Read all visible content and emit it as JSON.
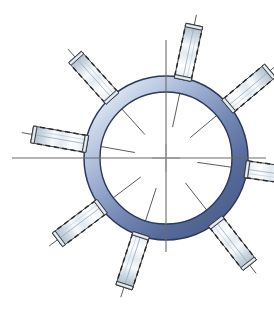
{
  "document": {
    "title": "Radial Bolt Ring Assembly",
    "background_color": "#ffffff",
    "width": 274,
    "height": 322,
    "drawing_type": "mechanical-assembly-schematic"
  },
  "ring": {
    "name": "annular-flange",
    "center_x": 166,
    "center_y": 158,
    "outer_radius": 82,
    "inner_radius": 66,
    "outline_color": "#2b3a5c",
    "outline_width": 1.4,
    "gradient_light": "#e8edf6",
    "gradient_mid": "#aab9d8",
    "gradient_dark": "#5f739f",
    "gradient_darkest": "#4a5c86"
  },
  "centerlines": {
    "name": "center-axes",
    "color": "#6b6b6b",
    "width": 1,
    "horizontal": {
      "x1": 12,
      "y1": 158,
      "x2": 266,
      "y2": 158
    },
    "vertical": {
      "x1": 166,
      "y1": 40,
      "x2": 166,
      "y2": 252
    },
    "crosshair_arm": 18
  },
  "bolts": {
    "count": 8,
    "body_color_light": "#ffffff",
    "body_color_mid": "#dfe6ee",
    "body_color_shade": "#b9c6d2",
    "outline_color": "#3a3a3a",
    "thread_dash_color": "#2b2b2b",
    "axis_color": "#4a4a4a",
    "length": 56,
    "width": 17,
    "items": [
      {
        "id": "bolt-1",
        "label": "bolt-n",
        "angle_deg": -78,
        "mount_radius": 74,
        "offset": 34
      },
      {
        "id": "bolt-2",
        "label": "bolt-ne",
        "angle_deg": -40,
        "mount_radius": 74,
        "offset": 34
      },
      {
        "id": "bolt-3",
        "label": "bolt-e",
        "angle_deg": 8,
        "mount_radius": 74,
        "offset": 34
      },
      {
        "id": "bolt-4",
        "label": "bolt-se",
        "angle_deg": 52,
        "mount_radius": 74,
        "offset": 34
      },
      {
        "id": "bolt-5",
        "label": "bolt-s",
        "angle_deg": 108,
        "mount_radius": 74,
        "offset": 34
      },
      {
        "id": "bolt-6",
        "label": "bolt-sw",
        "angle_deg": 143,
        "mount_radius": 74,
        "offset": 34
      },
      {
        "id": "bolt-7",
        "label": "bolt-w",
        "angle_deg": 190,
        "mount_radius": 74,
        "offset": 34
      },
      {
        "id": "bolt-8",
        "label": "bolt-nw",
        "angle_deg": 228,
        "mount_radius": 74,
        "offset": 34
      }
    ]
  },
  "bolt_axes": {
    "name": "bolt-centerlines",
    "color": "#4a4a4a",
    "width": 0.9,
    "inner_extent": 42,
    "outer_extent": 72
  }
}
